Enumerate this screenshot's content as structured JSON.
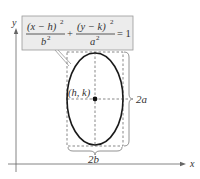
{
  "diagram": {
    "type": "ellipse-vertical-major-axis",
    "equation": {
      "term1_numerator": "(x − h)",
      "term1_numerator_exp": "2",
      "term1_denominator": "b",
      "term1_denominator_exp": "2",
      "plus": "+",
      "term2_numerator": "(y − k)",
      "term2_numerator_exp": "2",
      "term2_denominator": "a",
      "term2_denominator_exp": "2",
      "equals": "= 1"
    },
    "center_label": "(h, k)",
    "vertical_axis_label": "2a",
    "horizontal_axis_label": "2b",
    "axes": {
      "x_label": "x",
      "y_label": "y"
    },
    "colors": {
      "ellipse": "#1a1a1a",
      "dashed": "#555555",
      "axis": "#666666",
      "equation_box_fill": "#ececec",
      "equation_box_border": "#9a9a9a"
    }
  }
}
